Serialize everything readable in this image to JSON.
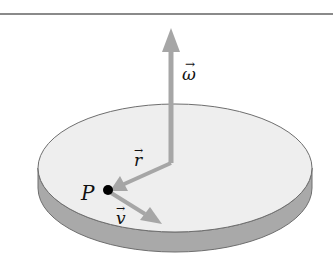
{
  "diagram": {
    "labels": {
      "omega": "ω",
      "r": "r",
      "v": "v",
      "point": "P"
    },
    "vector_accent": "→",
    "colors": {
      "disk_top": "#eeeeee",
      "disk_side": "#a9a9a9",
      "disk_outline": "#6e6e6e",
      "arrow": "#a6a6a6",
      "point": "#000000",
      "rule": "#8a8a8a"
    }
  }
}
